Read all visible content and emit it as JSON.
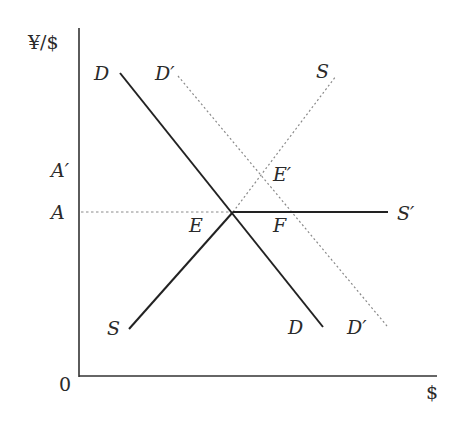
{
  "diagram": {
    "type": "supply-demand (foreign exchange market)",
    "axes": {
      "y_label": "¥/$",
      "x_label": "$",
      "origin_label": "0"
    },
    "price_levels": [
      {
        "name": "A",
        "label": "A"
      },
      {
        "name": "A_prime",
        "label": "A′"
      }
    ],
    "curves": [
      {
        "name": "D",
        "label_start": "D",
        "label_end": "D",
        "style": "solid",
        "from": [
          120,
          73
        ],
        "to": [
          323,
          327
        ]
      },
      {
        "name": "D_prime",
        "label_start": "D′",
        "label_end": "D′",
        "style": "dotted",
        "from": [
          178,
          76
        ],
        "to": [
          387,
          326
        ]
      },
      {
        "name": "S_lower",
        "label": "S",
        "style": "solid",
        "from": [
          129,
          329
        ],
        "to": [
          233,
          212
        ]
      },
      {
        "name": "S_upper",
        "label": "S",
        "style": "dotted",
        "from": [
          233,
          212
        ],
        "to": [
          336,
          76
        ]
      },
      {
        "name": "S_prime",
        "label": "S′",
        "style": "solid",
        "from": [
          233,
          212
        ],
        "to": [
          388,
          212
        ]
      }
    ],
    "guide_lines": [
      {
        "name": "A-level",
        "style": "dashed",
        "from": [
          81,
          212
        ],
        "to": [
          233,
          212
        ]
      }
    ],
    "points": [
      {
        "name": "E",
        "label": "E"
      },
      {
        "name": "E_prime",
        "label": "E′"
      },
      {
        "name": "F",
        "label": "F"
      }
    ]
  },
  "colors": {
    "axis": "#333333",
    "solid_line": "#222222",
    "dotted_line": "#8a8a8a",
    "text": "#2a2a2a"
  }
}
